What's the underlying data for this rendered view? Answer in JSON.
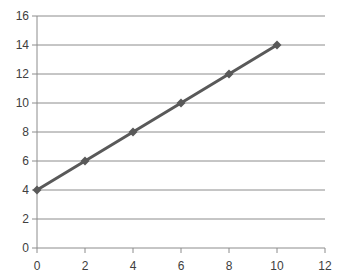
{
  "chart_data": {
    "type": "line",
    "title": "",
    "xlabel": "",
    "ylabel": "",
    "x": [
      0,
      2,
      4,
      6,
      8,
      10
    ],
    "series": [
      {
        "name": "Series1",
        "values": [
          4,
          6,
          8,
          10,
          12,
          14
        ],
        "color": "#595959",
        "marker": "diamond"
      }
    ],
    "xlim": [
      0,
      12
    ],
    "ylim": [
      0,
      16
    ],
    "xticks": [
      0,
      2,
      4,
      6,
      8,
      10,
      12
    ],
    "yticks": [
      0,
      2,
      4,
      6,
      8,
      10,
      12,
      14,
      16
    ],
    "grid": {
      "horizontal": true,
      "vertical": false,
      "color": "#8c8c8c"
    },
    "legend": null
  },
  "plot": {
    "left": 37,
    "right": 325,
    "top": 16,
    "bottom": 248
  }
}
